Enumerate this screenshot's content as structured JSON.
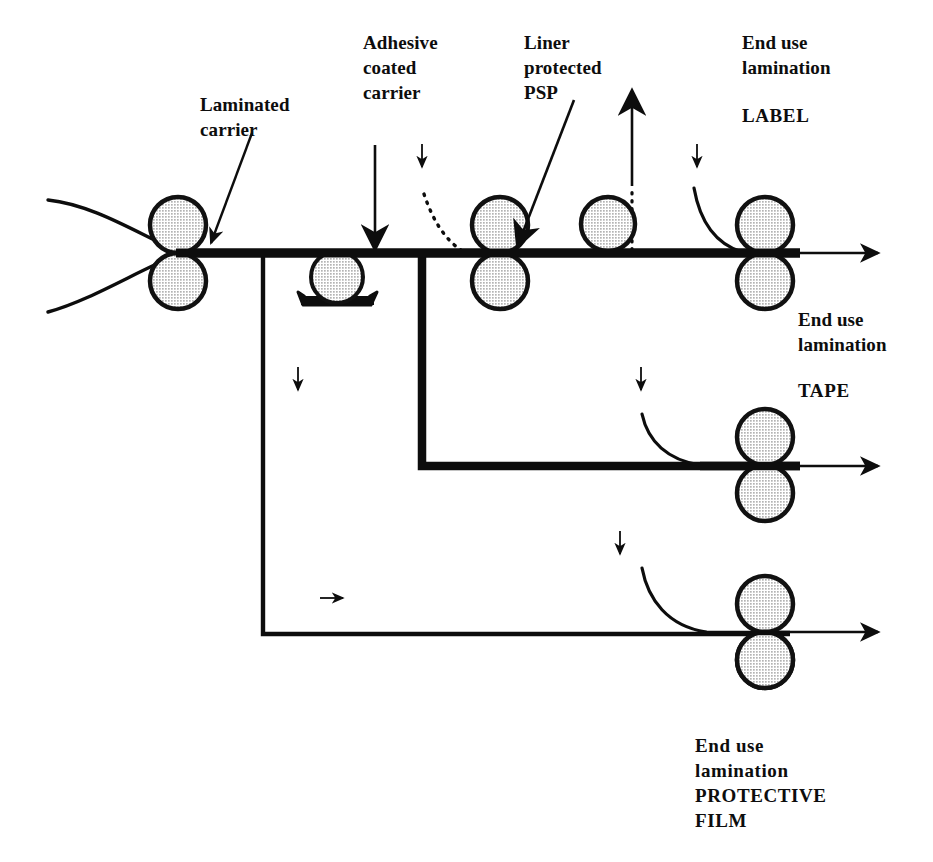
{
  "diagram": {
    "background_color": "#ffffff",
    "ink_color": "#0d0d0d",
    "roller_fill_color": "#cccccc",
    "roller_stroke_color": "#111111",
    "labels": {
      "laminated_carrier": "Laminated\ncarrier",
      "adhesive_coated_carrier": "Adhesive\ncoated\ncarrier",
      "liner_protected_psp": "Liner\nprotected\nPSP",
      "end_use_lamination_top": "End use\nlamination",
      "label_product": "LABEL",
      "end_use_lamination_middle": "End use\nlamination",
      "tape_product": "TAPE",
      "end_use_lamination_bottom": "End use\nlamination\nPROTECTIVE\nFILM"
    },
    "stations": [
      {
        "name": "laminating-nip",
        "type": "nip-roller-pair",
        "x": 178,
        "y": 253
      },
      {
        "name": "adhesive-coating-station",
        "type": "coating-roller-with-pan",
        "x": 337,
        "y": 276
      },
      {
        "name": "liner-application-nip",
        "type": "nip-roller-pair",
        "x": 500,
        "y": 253
      },
      {
        "name": "idler-roller",
        "type": "single-roller",
        "x": 608,
        "y": 225
      },
      {
        "name": "label-lamination-nip",
        "type": "nip-roller-pair",
        "x": 765,
        "y": 253
      },
      {
        "name": "tape-lamination-nip",
        "type": "nip-roller-pair",
        "x": 765,
        "y": 465
      },
      {
        "name": "protective-film-lamination-nip",
        "type": "nip-roller-pair",
        "x": 765,
        "y": 632
      }
    ],
    "web_paths": [
      {
        "name": "main-web-line",
        "y": 253,
        "from_x": 178,
        "to_x": 880,
        "weight": "thick"
      },
      {
        "name": "tape-branch",
        "corner_x": 422,
        "from_y": 253,
        "to_y": 466,
        "to_x": 880,
        "weight": "thick"
      },
      {
        "name": "protective-film-branch",
        "corner_x": 263,
        "from_y": 253,
        "to_y": 634,
        "to_x": 880,
        "weight": "thin"
      }
    ],
    "flow_arrows": [
      {
        "name": "liner-takeup-arrow",
        "direction": "up",
        "x": 632,
        "y_from": 253,
        "y_to": 90
      },
      {
        "name": "adhesive-feed-arrow",
        "direction": "down",
        "x": 375,
        "y_from": 145,
        "y_to": 253
      },
      {
        "name": "hint-arrow-adhesive",
        "direction": "down",
        "x": 422,
        "y": 155
      },
      {
        "name": "hint-arrow-label",
        "direction": "down",
        "x": 697,
        "y": 155
      },
      {
        "name": "hint-arrow-left-branch",
        "direction": "down",
        "x": 298,
        "y": 378
      },
      {
        "name": "hint-arrow-tape",
        "direction": "down",
        "x": 641,
        "y": 378
      },
      {
        "name": "hint-arrow-film",
        "direction": "down",
        "x": 620,
        "y": 542
      },
      {
        "name": "hint-arrow-bottom-run",
        "direction": "right",
        "x": 330,
        "y": 598
      }
    ]
  }
}
